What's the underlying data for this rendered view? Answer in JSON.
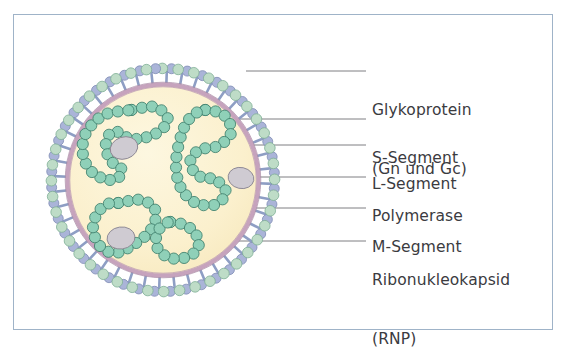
{
  "figure": {
    "kind": "virus-particle-schematic",
    "language": "de"
  },
  "frame": {
    "border_color": "#9fb3c8",
    "background": "#ffffff"
  },
  "virion": {
    "center_x": 163,
    "center_y": 180,
    "membrane_radius": 97,
    "interior_color": "#fbf0cd",
    "membrane_color": "#c6a3bd",
    "membrane_width": 4,
    "spike_count": 44,
    "spike_stalk_color": "#8e9ec4",
    "spike_lobe_blue": "#aab4d8",
    "spike_lobe_green": "#bedcc7",
    "rnp_bead_color": "#8fd0b8",
    "rnp_bead_outline": "#3f7f6d",
    "rnp_bead_radius": 5.6,
    "polymerase_color": "#cfcbd2",
    "polymerase_outline": "#8c8793",
    "leader_line_color": "#6f6f74"
  },
  "labels": [
    {
      "id": "glykoprotein",
      "line1": "Glykoprotein",
      "line2": "(Gn und Gc)",
      "text_x": 372,
      "text_y": 62,
      "leader_y": 71,
      "leader_x1": 246,
      "leader_x2": 366
    },
    {
      "id": "s-segment",
      "line1": "S-Segment",
      "line2": "",
      "text_x": 372,
      "text_y": 110,
      "leader_y": 119,
      "leader_x1": 148,
      "leader_x2": 366
    },
    {
      "id": "l-segment",
      "line1": "L-Segment",
      "line2": "",
      "text_x": 372,
      "text_y": 136,
      "leader_y": 145,
      "leader_x1": 232,
      "leader_x2": 366
    },
    {
      "id": "polymerase",
      "line1": "Polymerase",
      "line2": "",
      "text_x": 372,
      "text_y": 168,
      "leader_y": 177,
      "leader_x1": 248,
      "leader_x2": 366
    },
    {
      "id": "m-segment",
      "line1": "M-Segment",
      "line2": "",
      "text_x": 372,
      "text_y": 199,
      "leader_y": 208,
      "leader_x1": 186,
      "leader_x2": 366
    },
    {
      "id": "ribonukleokapsid",
      "line1": "Ribonukleokapsid",
      "line2": "(RNP)",
      "text_x": 372,
      "text_y": 232,
      "leader_y": 241,
      "leader_x1": 238,
      "leader_x2": 366
    }
  ],
  "chart_data": {
    "type": "diagram",
    "components": [
      {
        "name": "Glykoprotein (Gn und Gc)",
        "role": "envelope surface spikes",
        "count": 44
      },
      {
        "name": "S-Segment",
        "role": "small RNA genome segment",
        "count": 1
      },
      {
        "name": "M-Segment",
        "role": "medium RNA genome segment",
        "count": 1
      },
      {
        "name": "L-Segment",
        "role": "large RNA genome segment",
        "count": 1
      },
      {
        "name": "Polymerase",
        "role": "RNA-dependent RNA polymerase",
        "count": 3
      },
      {
        "name": "Ribonukleokapsid (RNP)",
        "role": "nucleoprotein-coated RNA chains",
        "count": 3
      }
    ]
  }
}
